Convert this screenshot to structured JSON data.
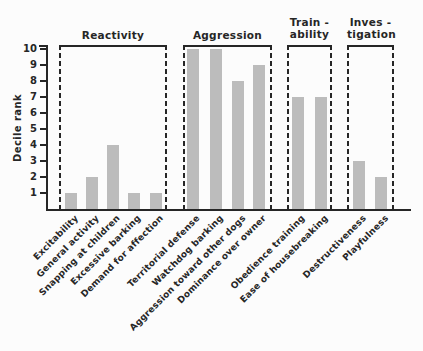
{
  "figure": {
    "background_color": "#fcfcfc",
    "bar_color": "#bcbcbc",
    "line_color": "#262626",
    "text_color": "#262626"
  },
  "chart_data": {
    "type": "bar",
    "title": "",
    "xlabel": "",
    "ylabel": "Decile rank",
    "ylim": [
      0,
      10
    ],
    "yticks": [
      1,
      2,
      3,
      4,
      5,
      6,
      7,
      8,
      9,
      10
    ],
    "grid": false,
    "legend": "none",
    "groups": [
      {
        "label": "Reactivity",
        "label_lines": [
          "Reactivity"
        ],
        "categories": [
          "Excitability",
          "General activity",
          "Snapping at children",
          "Excessive barking",
          "Demand for affection"
        ],
        "values": [
          1,
          2,
          4,
          1,
          1
        ]
      },
      {
        "label": "Aggression",
        "label_lines": [
          "Aggression"
        ],
        "categories": [
          "Territorial defense",
          "Watchdog barking",
          "Aggression toward other dogs",
          "Dominance over owner"
        ],
        "values": [
          10,
          10,
          8,
          9
        ]
      },
      {
        "label": "Trainability",
        "label_lines": [
          "Train -",
          "ability"
        ],
        "categories": [
          "Obedience training",
          "Ease of housebreaking"
        ],
        "values": [
          7,
          7
        ]
      },
      {
        "label": "Investigation",
        "label_lines": [
          "Inves -",
          "tigation"
        ],
        "categories": [
          "Destructiveness",
          "Playfulness"
        ],
        "values": [
          3,
          2
        ]
      }
    ]
  }
}
